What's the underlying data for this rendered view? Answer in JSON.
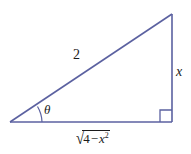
{
  "figure": {
    "type": "right-triangle-trigonometry-diagram",
    "background_color": "#ffffff",
    "stroke_color": "#5b61a0",
    "text_color": "#1b1b1b"
  },
  "labels": {
    "hypotenuse": "2",
    "opposite_side": "x",
    "angle": "θ",
    "adjacent_radical_sign": "√",
    "adjacent_radicand_number": "4",
    "adjacent_radicand_operator": "−",
    "adjacent_radicand_variable": "x",
    "adjacent_radicand_exponent": "2",
    "adjacent_full": "√(4 − x²)"
  },
  "geometry": {
    "left_vertex": "(10, 122)",
    "apex_vertex": "(172, 14)",
    "right_angle_vertex": "(172, 122)",
    "right_angle_marker": "square",
    "angle_arc": "theta"
  }
}
